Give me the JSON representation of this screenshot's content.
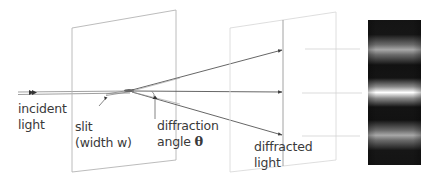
{
  "diagram": {
    "labels": {
      "incident_line1": "incident",
      "incident_line2": "light",
      "slit_line1": "slit",
      "slit_line2": "(width w)",
      "angle_line1": "diffraction",
      "angle_line2": "angle",
      "angle_symbol": "θ",
      "diffracted_line1": "diffracted",
      "diffracted_line2": "light"
    },
    "colors": {
      "background": "#ffffff",
      "plane_edge": "#b8b8b8",
      "plane_edge_light": "#dcdcdc",
      "ray": "#555555",
      "text": "#3a3a3a",
      "fringe_dark": "#111111",
      "fringe_bright": "#ffffff"
    },
    "elements": {
      "slit_plane": "slit-screen",
      "observation_plane": "observation-screen",
      "fringe_pattern": "diffraction-fringe-pattern",
      "rays": [
        "upper-diffracted-ray",
        "central-ray",
        "lower-diffracted-ray"
      ]
    }
  }
}
